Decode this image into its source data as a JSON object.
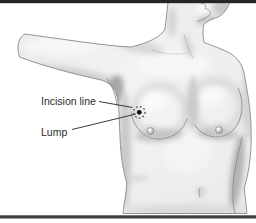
{
  "page": {
    "background": "#ffffff"
  },
  "bars": {
    "top_color": "#262626",
    "bottom_color": "#3d3d3d"
  },
  "illustration": {
    "description": "Female torso with right arm extended, showing a breast lump marked by a dot and a dotted incision line circle on the upper inner right breast",
    "labels": {
      "incision": "Incision line",
      "lump": "Lump"
    },
    "colors": {
      "skin_base": "#efefef",
      "skin_shadow": "#b7b7b7",
      "outline": "#949494",
      "label_text": "#2b2b2b",
      "leader_line": "#3a3a3a",
      "lump_dot": "#111111"
    }
  }
}
